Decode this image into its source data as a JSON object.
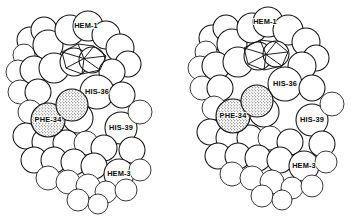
{
  "figure": {
    "kind": "stereo-pair-space-filling-molecular-model",
    "background_color": "#ffffff",
    "line_color": "#121212",
    "sphere_fill": "#ffffff",
    "highlight_fill": "#f2f2f2",
    "panel_count": 2,
    "panel_names": [
      "left-stereo-view",
      "right-stereo-view"
    ]
  },
  "labels": {
    "hem1": "HEM-1",
    "his36": "HIS-36",
    "phe34": "PHE-34",
    "his39": "HIS-39",
    "hem3": "HEM-3"
  },
  "label_positions": {
    "left": {
      "hem1": [
        86,
        26
      ],
      "his36": [
        97,
        92
      ],
      "phe34": [
        48,
        120
      ],
      "his39": [
        121,
        128
      ],
      "hem3": [
        119,
        174
      ]
    },
    "right": {
      "hem1": [
        265,
        22
      ],
      "his36": [
        285,
        84
      ],
      "phe34": [
        233,
        116
      ],
      "his39": [
        312,
        120
      ],
      "hem3": [
        304,
        166
      ]
    }
  },
  "atoms": {
    "left": [
      {
        "cx": 30,
        "cy": 40,
        "r": 13
      },
      {
        "cx": 44,
        "cy": 30,
        "r": 13
      },
      {
        "cx": 24,
        "cy": 55,
        "r": 11
      },
      {
        "cx": 48,
        "cy": 45,
        "r": 15
      },
      {
        "cx": 70,
        "cy": 30,
        "r": 15
      },
      {
        "cx": 88,
        "cy": 26,
        "r": 15
      },
      {
        "cx": 106,
        "cy": 35,
        "r": 14
      },
      {
        "cx": 120,
        "cy": 48,
        "r": 14
      },
      {
        "cx": 128,
        "cy": 64,
        "r": 13
      },
      {
        "cx": 18,
        "cy": 72,
        "r": 12
      },
      {
        "cx": 34,
        "cy": 70,
        "r": 14
      },
      {
        "cx": 54,
        "cy": 68,
        "r": 15
      },
      {
        "cx": 74,
        "cy": 62,
        "r": 14
      },
      {
        "cx": 92,
        "cy": 60,
        "r": 13
      },
      {
        "cx": 112,
        "cy": 72,
        "r": 13
      },
      {
        "cx": 20,
        "cy": 92,
        "r": 12
      },
      {
        "cx": 38,
        "cy": 92,
        "r": 13
      },
      {
        "cx": 97,
        "cy": 92,
        "r": 17
      },
      {
        "cx": 122,
        "cy": 95,
        "r": 13
      },
      {
        "cx": 30,
        "cy": 112,
        "r": 12
      },
      {
        "cx": 78,
        "cy": 118,
        "r": 15
      },
      {
        "cx": 121,
        "cy": 128,
        "r": 16
      },
      {
        "cx": 140,
        "cy": 112,
        "r": 12
      },
      {
        "cx": 26,
        "cy": 136,
        "r": 13
      },
      {
        "cx": 46,
        "cy": 142,
        "r": 14
      },
      {
        "cx": 66,
        "cy": 143,
        "r": 13
      },
      {
        "cx": 86,
        "cy": 143,
        "r": 12
      },
      {
        "cx": 104,
        "cy": 148,
        "r": 13
      },
      {
        "cx": 132,
        "cy": 150,
        "r": 13
      },
      {
        "cx": 34,
        "cy": 160,
        "r": 13
      },
      {
        "cx": 54,
        "cy": 160,
        "r": 13
      },
      {
        "cx": 74,
        "cy": 162,
        "r": 13
      },
      {
        "cx": 94,
        "cy": 166,
        "r": 13
      },
      {
        "cx": 119,
        "cy": 174,
        "r": 15
      },
      {
        "cx": 140,
        "cy": 170,
        "r": 11
      },
      {
        "cx": 48,
        "cy": 178,
        "r": 12
      },
      {
        "cx": 68,
        "cy": 182,
        "r": 12
      },
      {
        "cx": 88,
        "cy": 186,
        "r": 12
      },
      {
        "cx": 106,
        "cy": 192,
        "r": 11
      },
      {
        "cx": 126,
        "cy": 190,
        "r": 11
      },
      {
        "cx": 78,
        "cy": 200,
        "r": 11
      },
      {
        "cx": 98,
        "cy": 204,
        "r": 10
      }
    ],
    "right": [
      {
        "cx": 212,
        "cy": 38,
        "r": 13
      },
      {
        "cx": 226,
        "cy": 28,
        "r": 13
      },
      {
        "cx": 206,
        "cy": 52,
        "r": 11
      },
      {
        "cx": 232,
        "cy": 44,
        "r": 15
      },
      {
        "cx": 252,
        "cy": 28,
        "r": 15
      },
      {
        "cx": 268,
        "cy": 22,
        "r": 15
      },
      {
        "cx": 288,
        "cy": 30,
        "r": 15
      },
      {
        "cx": 306,
        "cy": 42,
        "r": 14
      },
      {
        "cx": 316,
        "cy": 58,
        "r": 13
      },
      {
        "cx": 200,
        "cy": 68,
        "r": 12
      },
      {
        "cx": 216,
        "cy": 66,
        "r": 14
      },
      {
        "cx": 238,
        "cy": 62,
        "r": 15
      },
      {
        "cx": 258,
        "cy": 56,
        "r": 14
      },
      {
        "cx": 276,
        "cy": 54,
        "r": 13
      },
      {
        "cx": 302,
        "cy": 66,
        "r": 14
      },
      {
        "cx": 202,
        "cy": 88,
        "r": 12
      },
      {
        "cx": 220,
        "cy": 88,
        "r": 13
      },
      {
        "cx": 285,
        "cy": 84,
        "r": 17
      },
      {
        "cx": 312,
        "cy": 88,
        "r": 13
      },
      {
        "cx": 214,
        "cy": 108,
        "r": 12
      },
      {
        "cx": 264,
        "cy": 112,
        "r": 15
      },
      {
        "cx": 312,
        "cy": 120,
        "r": 16
      },
      {
        "cx": 332,
        "cy": 104,
        "r": 12
      },
      {
        "cx": 210,
        "cy": 132,
        "r": 13
      },
      {
        "cx": 230,
        "cy": 138,
        "r": 14
      },
      {
        "cx": 250,
        "cy": 138,
        "r": 13
      },
      {
        "cx": 270,
        "cy": 138,
        "r": 12
      },
      {
        "cx": 290,
        "cy": 142,
        "r": 13
      },
      {
        "cx": 322,
        "cy": 144,
        "r": 13
      },
      {
        "cx": 218,
        "cy": 156,
        "r": 13
      },
      {
        "cx": 238,
        "cy": 156,
        "r": 13
      },
      {
        "cx": 258,
        "cy": 158,
        "r": 13
      },
      {
        "cx": 280,
        "cy": 160,
        "r": 13
      },
      {
        "cx": 304,
        "cy": 166,
        "r": 15
      },
      {
        "cx": 326,
        "cy": 162,
        "r": 11
      },
      {
        "cx": 232,
        "cy": 174,
        "r": 12
      },
      {
        "cx": 252,
        "cy": 178,
        "r": 12
      },
      {
        "cx": 272,
        "cy": 182,
        "r": 12
      },
      {
        "cx": 292,
        "cy": 188,
        "r": 11
      },
      {
        "cx": 312,
        "cy": 186,
        "r": 11
      },
      {
        "cx": 262,
        "cy": 196,
        "r": 11
      },
      {
        "cx": 282,
        "cy": 200,
        "r": 10
      }
    ]
  },
  "stippled_atoms": {
    "left": [
      {
        "cx": 48,
        "cy": 120,
        "r": 17
      },
      {
        "cx": 72,
        "cy": 105,
        "r": 16
      }
    ],
    "right": [
      {
        "cx": 233,
        "cy": 116,
        "r": 17
      },
      {
        "cx": 257,
        "cy": 101,
        "r": 16
      }
    ]
  },
  "heme_facets": {
    "left": [
      [
        62,
        52
      ],
      [
        78,
        44
      ],
      [
        94,
        46
      ],
      [
        106,
        56
      ],
      [
        100,
        70
      ],
      [
        82,
        74
      ],
      [
        66,
        68
      ]
    ],
    "right": [
      [
        244,
        48
      ],
      [
        260,
        40
      ],
      [
        276,
        42
      ],
      [
        288,
        52
      ],
      [
        282,
        66
      ],
      [
        264,
        70
      ],
      [
        248,
        64
      ]
    ]
  }
}
